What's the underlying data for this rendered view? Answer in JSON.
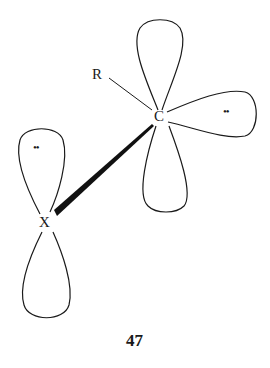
{
  "diagram": {
    "atoms": {
      "carbon": "C",
      "substituent": "R",
      "heteroatom": "X"
    },
    "lone_pairs": {
      "carbon_lone_pair": "••",
      "x_lone_pair": "••"
    },
    "caption": "47",
    "colors": {
      "stroke": "#1a1a1a",
      "background": "#ffffff"
    }
  }
}
